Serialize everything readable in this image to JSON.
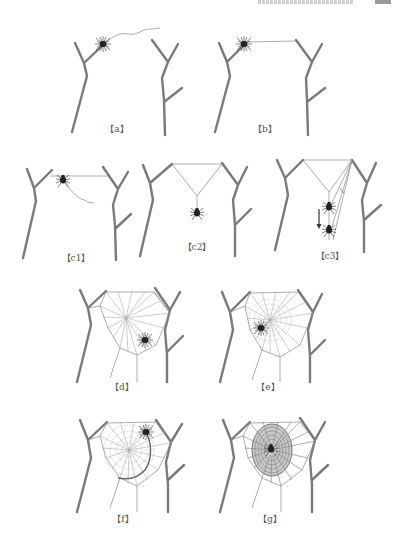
{
  "figure": {
    "header_clipped": true,
    "panels": [
      {
        "id": "a",
        "label": "【a】",
        "caption_hint": "spider releases a drifting silk line from the twig"
      },
      {
        "id": "b",
        "label": "【b】",
        "caption_hint": "bridge line attaches to the opposite twig"
      },
      {
        "id": "c1",
        "label": "【c1】",
        "caption_hint": "spider walks bridge line trailing a loose thread"
      },
      {
        "id": "c2",
        "label": "【c2】",
        "caption_hint": "Y-shaped frame formed; spider drops down"
      },
      {
        "id": "c3",
        "label": "【c3】",
        "caption_hint": "spider descends and adds further frame lines (arrow indicates descent)"
      },
      {
        "id": "d",
        "label": "【d】",
        "caption_hint": "radial lines and frame completed"
      },
      {
        "id": "e",
        "label": "【e】",
        "caption_hint": "temporary auxiliary spiral laid from hub"
      },
      {
        "id": "f",
        "label": "【f】",
        "caption_hint": "sticky capture spiral laid from outside inward"
      },
      {
        "id": "g",
        "label": "【g】",
        "caption_hint": "completed orb web with dense capture spiral"
      }
    ],
    "colors": {
      "branch": "#7a7a7a",
      "silk": "#8a8a8a",
      "spider": "#222222",
      "background": "#ffffff"
    }
  }
}
